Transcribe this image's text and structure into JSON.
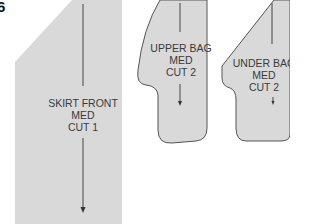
{
  "figure": {
    "number": "6",
    "colors": {
      "fill": "#d9d9d9",
      "outline": "#555555",
      "grainline": "#444444",
      "text": "#3a3a3a"
    }
  },
  "pieces": [
    {
      "id": "skirt-front",
      "name": "SKIRT FRONT",
      "size": "MED",
      "cut": "CUT 1"
    },
    {
      "id": "upper-bag",
      "name": "UPPER BAG",
      "size": "MED",
      "cut": "CUT 2"
    },
    {
      "id": "under-bag",
      "name": "UNDER BAG",
      "size": "MED",
      "cut": "CUT 2"
    }
  ]
}
